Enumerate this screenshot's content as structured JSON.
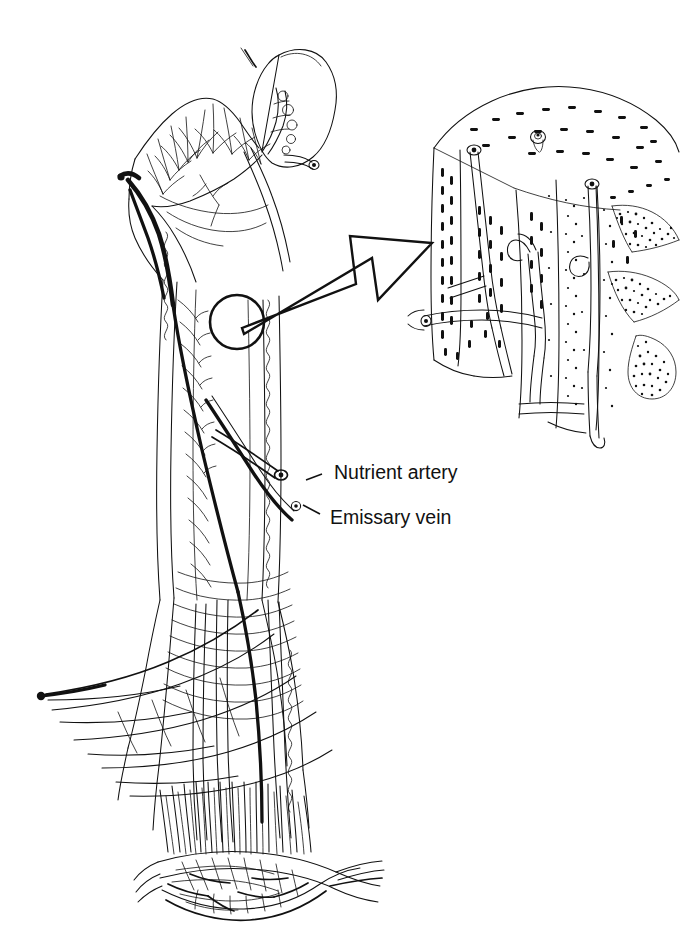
{
  "figure": {
    "background_color": "#ffffff",
    "ink_color": "#111111",
    "width": 689,
    "height": 936
  },
  "labels": [
    {
      "id": "nutrient-artery",
      "text": "Nutrient artery",
      "x": 334,
      "y": 474,
      "leader": {
        "x1": 322,
        "y1": 474,
        "x2": 306,
        "y2": 482
      }
    },
    {
      "id": "emissary-vein",
      "text": "Emissary vein",
      "x": 330,
      "y": 519,
      "leader": {
        "x1": 318,
        "y1": 515,
        "x2": 300,
        "y2": 504
      }
    }
  ],
  "callout": {
    "circle": {
      "cx": 237,
      "cy": 322,
      "r": 27,
      "stroke_width": 2.6
    },
    "arrow": {
      "name": "magnify-arrow",
      "from_x": 240,
      "from_y": 327,
      "to_x": 432,
      "to_y": 243,
      "style": "hollow-outlined"
    }
  },
  "inset": {
    "name": "cortical-bone-detail",
    "x": 424,
    "y": 94,
    "width": 255,
    "height": 340,
    "description": "Magnified block of cortical bone showing nutrient vessel canals piercing the cortex"
  },
  "bone": {
    "name": "femur",
    "regions": [
      "femoral-head",
      "femoral-neck",
      "greater-trochanter",
      "lesser-trochanter",
      "diaphysis",
      "distal-metaphysis",
      "physis"
    ]
  },
  "vessels": {
    "nutrient_artery_color": "#111111",
    "emissary_vein_color": "#111111"
  }
}
